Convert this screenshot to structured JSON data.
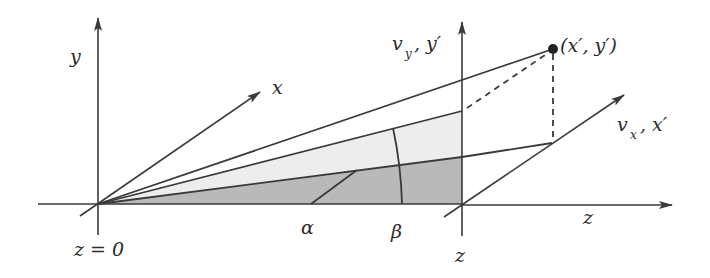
{
  "figure": {
    "colors": {
      "line": "#3a3a3a",
      "shade_dark": "#b8b8b8",
      "shade_light": "#ececec",
      "point": "#222222"
    },
    "labels": {
      "y_axis": "y",
      "x_axis": "x",
      "z_origin": "z = 0",
      "alpha": "α",
      "beta": "β",
      "z_plane": "z",
      "z_axis": "z",
      "vy_main": "v",
      "vy_sub": "y",
      "vy_rest": ", y′",
      "vx_main": "v",
      "vx_sub": "x",
      "vx_rest": ", x′",
      "point": "(x′, y′)"
    }
  }
}
